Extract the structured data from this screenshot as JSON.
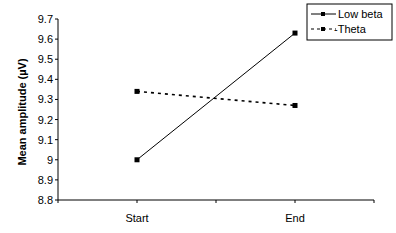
{
  "chart_data": {
    "type": "line",
    "title": "",
    "xlabel": "",
    "ylabel": "Mean amplitude (µV)",
    "categories": [
      "Start",
      "End"
    ],
    "series": [
      {
        "name": "Low beta",
        "values": [
          9.0,
          9.63
        ],
        "style": "solid"
      },
      {
        "name": "Theta",
        "values": [
          9.34,
          9.27
        ],
        "style": "dashed"
      }
    ],
    "ylim": [
      8.8,
      9.7
    ],
    "yticks": [
      "8.8",
      "8.9",
      "9",
      "9.1",
      "9.2",
      "9.3",
      "9.4",
      "9.5",
      "9.6",
      "9.7"
    ],
    "grid": false,
    "legend_position": "top-right"
  },
  "legend": {
    "items": [
      "Low beta",
      "-Theta"
    ]
  }
}
